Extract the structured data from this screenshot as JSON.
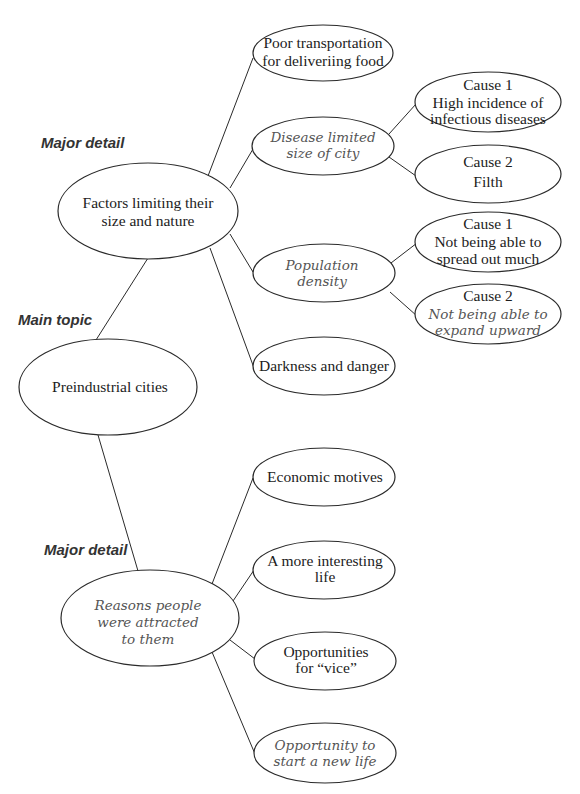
{
  "diagram": {
    "type": "concept-map",
    "colors": {
      "line": "#2a2a2a",
      "text": "#1c1c1c",
      "italic_text": "#555555",
      "category_text": "#333333",
      "background": "#ffffff"
    },
    "category_labels": {
      "major_detail_top": "Major detail",
      "main_topic": "Main topic",
      "major_detail_bottom": "Major detail"
    },
    "nodes": {
      "preindustrial_cities": {
        "lines": [
          "Preindustrial cities"
        ],
        "style": "serif"
      },
      "factors_limiting": {
        "lines": [
          "Factors limiting their",
          "size and nature"
        ],
        "style": "serif"
      },
      "poor_transportation": {
        "lines": [
          "Poor transportation",
          "for deliveriing food"
        ],
        "style": "serif"
      },
      "disease_limited": {
        "lines": [
          "Disease limited",
          "size of city"
        ],
        "style": "italic"
      },
      "cause1_infectious": {
        "lines": [
          "Cause 1",
          "High incidence of",
          "infectious diseases"
        ],
        "style": "serif"
      },
      "cause2_filth": {
        "lines": [
          "Cause 2",
          "Filth"
        ],
        "style": "serif"
      },
      "population_density": {
        "lines": [
          "Population",
          "density"
        ],
        "style": "italic"
      },
      "cause1_spread": {
        "lines": [
          "Cause 1",
          "Not being able to",
          "spread out much"
        ],
        "style": "serif"
      },
      "cause2_expand": {
        "lines": [
          "Cause 2",
          "Not being able to",
          "expand upward"
        ],
        "style": "mixed"
      },
      "darkness_danger": {
        "lines": [
          "Darkness and danger"
        ],
        "style": "serif"
      },
      "reasons_attracted": {
        "lines": [
          "Reasons people",
          "were attracted",
          "to them"
        ],
        "style": "italic"
      },
      "economic_motives": {
        "lines": [
          "Economic motives"
        ],
        "style": "serif"
      },
      "interesting_life": {
        "lines": [
          "A more interesting",
          "life"
        ],
        "style": "serif"
      },
      "opportunities_vice": {
        "lines": [
          "Opportunities",
          "for “vice”"
        ],
        "style": "serif"
      },
      "new_life": {
        "lines": [
          "Opportunity to",
          "start a new life"
        ],
        "style": "italic"
      }
    },
    "edges": [
      [
        "preindustrial_cities",
        "factors_limiting"
      ],
      [
        "preindustrial_cities",
        "reasons_attracted"
      ],
      [
        "factors_limiting",
        "poor_transportation"
      ],
      [
        "factors_limiting",
        "disease_limited"
      ],
      [
        "factors_limiting",
        "population_density"
      ],
      [
        "factors_limiting",
        "darkness_danger"
      ],
      [
        "disease_limited",
        "cause1_infectious"
      ],
      [
        "disease_limited",
        "cause2_filth"
      ],
      [
        "population_density",
        "cause1_spread"
      ],
      [
        "population_density",
        "cause2_expand"
      ],
      [
        "reasons_attracted",
        "economic_motives"
      ],
      [
        "reasons_attracted",
        "interesting_life"
      ],
      [
        "reasons_attracted",
        "opportunities_vice"
      ],
      [
        "reasons_attracted",
        "new_life"
      ]
    ]
  }
}
